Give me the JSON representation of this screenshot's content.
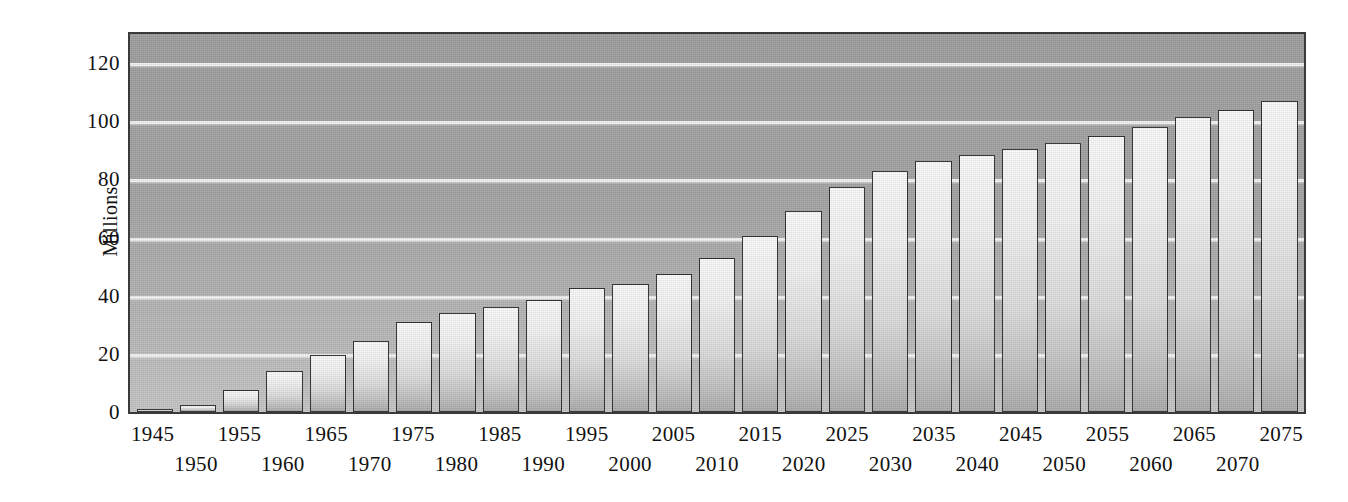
{
  "chart_data": {
    "type": "bar",
    "title": "",
    "xlabel": "",
    "ylabel": "Millions",
    "ylim": [
      0,
      130
    ],
    "yticks": [
      0,
      20,
      40,
      60,
      80,
      100,
      120
    ],
    "gridlines": [
      20,
      40,
      60,
      80,
      100,
      120
    ],
    "grid": true,
    "legend": "none",
    "categories": [
      "1945",
      "1950",
      "1955",
      "1960",
      "1965",
      "1970",
      "1975",
      "1980",
      "1985",
      "1990",
      "1995",
      "2000",
      "2005",
      "2010",
      "2015",
      "2020",
      "2025",
      "2030",
      "2035",
      "2040",
      "2045",
      "2050",
      "2055",
      "2060",
      "2065",
      "2070",
      "2075"
    ],
    "values": [
      1,
      2.5,
      7.5,
      14,
      19.5,
      24.5,
      31,
      34,
      36,
      38.5,
      42.5,
      44,
      47.5,
      53,
      60.5,
      69,
      77.5,
      83,
      86.5,
      88.5,
      90.5,
      92.5,
      95,
      98,
      101.5,
      104,
      107
    ]
  },
  "axis": {
    "y_title": "Millions",
    "y_tick_labels": [
      "120",
      "100",
      "80",
      "60",
      "40",
      "20",
      "0"
    ]
  },
  "colors": {
    "plot_background_top": "#9e9e9e",
    "plot_background_bottom": "#c6c6c6",
    "gridline": "#f2f2f2",
    "bar_fill_top": "#fbfbfb",
    "bar_fill_bottom": "#ababab",
    "bar_border": "#2e2e2e",
    "axis_border": "#3a3a3a",
    "text": "#111111",
    "page_background": "#ffffff"
  }
}
